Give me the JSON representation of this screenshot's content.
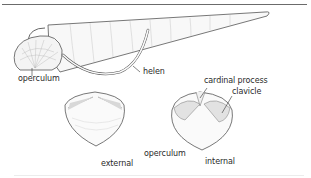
{
  "figure": {
    "labels": {
      "operculum_top": "operculum",
      "helen": "helen",
      "cardinal_process": "cardinal process",
      "clavicle": "clavicle",
      "external": "external",
      "operculum_bottom": "operculum",
      "internal": "internal"
    },
    "colors": {
      "line": "#555555",
      "shell_fill": "#f7f7f7",
      "text": "#2a2a2a",
      "rule": "#6b6b6b"
    }
  }
}
